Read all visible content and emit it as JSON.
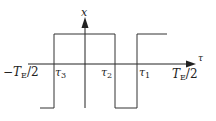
{
  "diagram": {
    "type": "square-wave-plot",
    "axes": {
      "y_label": "x",
      "x_label": "τ"
    },
    "ticks": {
      "left_bound": {
        "main": "−T",
        "sub": "E",
        "rest": "/2"
      },
      "right_bound": {
        "main": "T",
        "sub": "E",
        "rest": "/2"
      },
      "tau3": {
        "main": "τ",
        "sub": "3"
      },
      "tau2": {
        "main": "τ",
        "sub": "2"
      },
      "tau1": {
        "main": "τ",
        "sub": "1"
      }
    },
    "colors": {
      "line": "#222222",
      "background": "#ffffff"
    }
  }
}
